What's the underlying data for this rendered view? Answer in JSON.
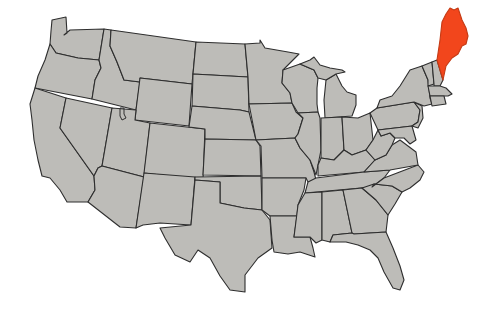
{
  "map": {
    "subject": "United States",
    "highlighted_state": "Maine",
    "colors": {
      "land": "#bdbcb8",
      "border": "#2e2e2e",
      "highlight": "#f2461c",
      "background": "#ffffff"
    }
  }
}
